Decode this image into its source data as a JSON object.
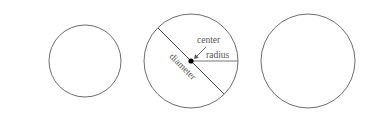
{
  "diagram": {
    "labels": {
      "center": "center",
      "radius": "radius",
      "diameter": "diameter"
    },
    "colors": {
      "background": "#ffffff",
      "stroke": "#6e6e6e",
      "text": "#555555",
      "dot": "#000000"
    },
    "circles": [
      {
        "name": "small-circle",
        "cx": 85,
        "cy": 61,
        "r": 36
      },
      {
        "name": "annotated-circle",
        "cx": 191,
        "cy": 61,
        "r": 47
      },
      {
        "name": "large-circle",
        "cx": 308,
        "cy": 61,
        "r": 47
      }
    ]
  }
}
